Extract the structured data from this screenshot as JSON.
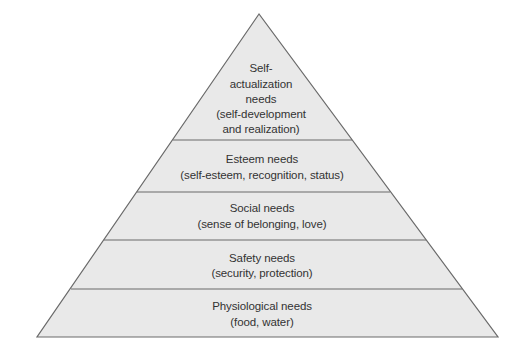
{
  "diagram": {
    "type": "pyramid",
    "colors": {
      "fill": "#e9e9e9",
      "stroke": "#6a6a6a",
      "text": "#333333",
      "background": "#ffffff"
    },
    "levels": [
      {
        "name": "Self-actualization needs",
        "lines": [
          "Self-",
          "actualization",
          "needs",
          "(self-development",
          "and realization)"
        ]
      },
      {
        "name": "Esteem needs",
        "lines": [
          "Esteem needs",
          "(self-esteem, recognition, status)"
        ]
      },
      {
        "name": "Social needs",
        "lines": [
          "Social needs",
          "(sense of belonging, love)"
        ]
      },
      {
        "name": "Safety needs",
        "lines": [
          "Safety needs",
          "(security, protection)"
        ]
      },
      {
        "name": "Physiological needs",
        "lines": [
          "Physiological needs",
          "(food, water)"
        ]
      }
    ]
  }
}
